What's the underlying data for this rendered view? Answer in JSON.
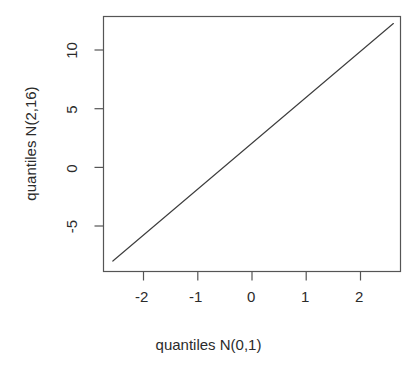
{
  "chart_data": {
    "type": "line",
    "title": "",
    "subtitle": "",
    "xlabel": "quantiles N(0,1)",
    "ylabel": "quantiles N(2,16)",
    "xlim": [
      -2.62,
      2.78
    ],
    "ylim": [
      -8.7,
      13.2
    ],
    "xticks": [
      -2,
      -1,
      0,
      1,
      2
    ],
    "xtick_labels": [
      "-2",
      "-1",
      "0",
      "1",
      "2"
    ],
    "yticks": [
      -5,
      0,
      5,
      10
    ],
    "ytick_labels": [
      "-5",
      "0",
      "5",
      "10"
    ],
    "grid": false,
    "legend": null,
    "annotations": [],
    "series": [
      {
        "name": "qq-line",
        "relation": "y = 2 + 4x",
        "x": [
          -2.45,
          -2.0,
          -1.0,
          0.0,
          1.0,
          2.0,
          2.65
        ],
        "y": [
          -7.8,
          -6.0,
          -2.0,
          2.0,
          6.0,
          10.0,
          12.6
        ],
        "color": "#3d3d3d",
        "width": 1
      }
    ]
  },
  "axes": {
    "x_tick_labels": [
      "-2",
      "-1",
      "0",
      "1",
      "2"
    ],
    "y_tick_labels": [
      "-5",
      "0",
      "5",
      "10"
    ],
    "x_title": "quantiles N(0,1)",
    "y_title": "quantiles N(2,16)"
  },
  "style": {
    "background": "#ffffff",
    "box_color": "#555555",
    "line_color": "#3d3d3d",
    "tick_color": "#555555",
    "text_color": "#2b2b2b"
  }
}
